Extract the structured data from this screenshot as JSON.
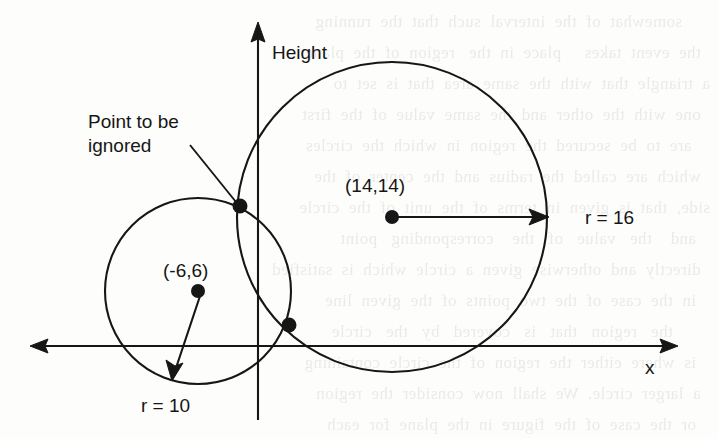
{
  "figure": {
    "axes": {
      "y_axis_label": "Height",
      "x_axis_label": "x"
    },
    "annotations": {
      "ignored_point_line1": "Point to be",
      "ignored_point_line2": "ignored"
    },
    "circles": [
      {
        "name": "large-circle",
        "center_label": "(14,14)",
        "radius_label": "r = 16",
        "center": [
          14,
          14
        ],
        "radius": 16
      },
      {
        "name": "small-circle",
        "center_label": "(-6,6)",
        "radius_label": "r = 10",
        "center": [
          -6,
          6
        ],
        "radius": 10
      }
    ],
    "colors": {
      "ink": "#161616",
      "paper": "#fdfdfb",
      "bleed": "#6b6f74"
    }
  },
  "background_bleed": {
    "lines": [
      "      somewhat  of  the  interval  such  that  the  running",
      "  the  event  takes     place  in  the   region  of  the  plane",
      "a  triangle  that  with  the  same  area  that  is  set  to",
      "  one  with  the  other  and  the  same  value  of  the  first",
      "    are  to  be  secured  the  region  in  which  the  circles",
      "  which  are  called  the  radius  and  the  center  of  the",
      "side,  that  is  given  in  terms  of  the  unit  of  the  circle",
      "   and    the   value   of   the    corresponding   point",
      "  directly  and  otherwise  given  a  circle  which  is  satisfied",
      "   in  the  case  of  the  two  points  of  the  given  line",
      "        the   region   that   is   covered   by   the   circle",
      "   is  where  either  the  region  of  the  circle  containing",
      "  a  larger  circle.  We  shall  now  consider  the  region",
      "   or  the  case  of  the  figure  in  the  plane  for  each"
    ]
  }
}
